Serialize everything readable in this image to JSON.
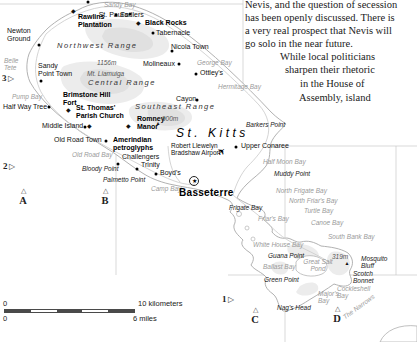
{
  "map": {
    "island_label": {
      "name": "St. Kitts",
      "pos": [
        176,
        127
      ]
    },
    "colors": {
      "water_label": "#9a9a9a",
      "land_shade": "#ececec",
      "coastline": "#a8a8a8",
      "graticule": "#c9c9c9",
      "scale_dark": "#4a4a4a"
    },
    "article": {
      "lines": [
        {
          "text": "Nevis, and the question of secession",
          "x": 245,
          "y": -1
        },
        {
          "text": "has been openly discussed. There is",
          "x": 245,
          "y": 12
        },
        {
          "text": "a very real prospect that Nevis will",
          "x": 245,
          "y": 25
        },
        {
          "text": "go solo in the near future.",
          "x": 245,
          "y": 38
        },
        {
          "text": "While local politicians",
          "x": 280,
          "y": 51
        },
        {
          "text": "sharpen their rhetoric",
          "x": 285,
          "y": 64
        },
        {
          "text": "in the House of",
          "x": 300,
          "y": 78
        },
        {
          "text": "Assembly, island",
          "x": 299,
          "y": 92
        }
      ]
    },
    "ranges": [
      {
        "name": "Northwest Range",
        "pos": [
          57,
          42
        ]
      },
      {
        "name": "Central Range",
        "pos": [
          88,
          79
        ]
      },
      {
        "name": "Southeast Range",
        "pos": [
          135,
          103
        ]
      }
    ],
    "towns": [
      {
        "name": "St. Paul's",
        "dot": [
          130,
          14
        ],
        "label": [
          128,
          11
        ],
        "align": "right"
      },
      {
        "name": "Sadlers",
        "dot": [
          116,
          15
        ],
        "label": [
          120,
          11
        ]
      },
      {
        "name": "Tabernacle",
        "dot": [
          153,
          33
        ],
        "label": [
          156,
          29
        ]
      },
      {
        "name": "Newton\nGround",
        "dot": [
          39,
          45
        ],
        "label": [
          7,
          27
        ]
      },
      {
        "name": "Nicola Town",
        "dot": [
          172,
          51
        ],
        "label": [
          171,
          43
        ]
      },
      {
        "name": "Sandy\nPoint Town",
        "dot": [
          41,
          81
        ],
        "label": [
          38,
          62
        ]
      },
      {
        "name": "Molineaux",
        "dot": [
          179,
          64
        ],
        "label": [
          143,
          60
        ]
      },
      {
        "name": "Ottley's",
        "dot": [
          196,
          74
        ],
        "label": [
          200,
          69
        ]
      },
      {
        "name": "Cayon",
        "dot": [
          197,
          100
        ],
        "label": [
          176,
          95
        ]
      },
      {
        "name": "Half Way Tree",
        "dot": [
          49,
          107
        ],
        "label": [
          3,
          103
        ]
      },
      {
        "name": "Middle Island",
        "dot": [
          85,
          127
        ],
        "label": [
          42,
          122
        ]
      },
      {
        "name": "Old Road Town",
        "dot": [
          106,
          141
        ],
        "label": [
          54,
          136
        ]
      },
      {
        "name": "Challengers",
        "dot": [
          118,
          164
        ],
        "label": [
          122,
          153
        ]
      },
      {
        "name": "Trinity",
        "dot": [
          137,
          169
        ],
        "label": [
          141,
          161
        ]
      },
      {
        "name": "Boyd's",
        "dot": [
          156,
          174
        ],
        "label": [
          160,
          169
        ]
      },
      {
        "name": "Upper Conaree",
        "dot": [
          236,
          147
        ],
        "label": [
          241,
          142
        ]
      }
    ],
    "sites": [
      {
        "name": "Rawlins\nPlantation",
        "diamond": [
          73,
          11
        ],
        "label": [
          78,
          13
        ]
      },
      {
        "name": "Black Rocks",
        "diamond": [
          138,
          23
        ],
        "label": [
          145,
          19
        ]
      },
      {
        "name": "Brimstone Hill\nFort",
        "diamond": [
          68,
          110
        ],
        "label": [
          63,
          91
        ]
      },
      {
        "name": "St. Thomas'\nParish Church",
        "diamond": [
          89,
          126
        ],
        "label": [
          76,
          104
        ]
      },
      {
        "name": "Romney\nManor",
        "diamond": [
          128,
          126
        ],
        "label": [
          137,
          115
        ]
      },
      {
        "name": "Amerindian\npetroglyphs",
        "diamond": null,
        "label": [
          113,
          136
        ]
      }
    ],
    "peaks": [
      {
        "name": "1156m",
        "label": [
          97,
          59
        ],
        "tri": null
      },
      {
        "name": "Mt. Liamuiga",
        "label": [
          87,
          70
        ],
        "tri": null
      },
      {
        "name": "900m",
        "label": [
          162,
          115
        ],
        "tri": [
          158,
          123
        ]
      },
      {
        "name": "319m",
        "label": [
          332,
          253
        ],
        "tri": [
          347,
          263
        ]
      }
    ],
    "water": [
      {
        "name": "Sandy Bay",
        "pos": [
          104,
          1
        ]
      },
      {
        "name": "Belle\nTete",
        "pos": [
          4,
          57
        ]
      },
      {
        "name": "Pump Bay",
        "pos": [
          12,
          93
        ]
      },
      {
        "name": "Old Road Bay",
        "pos": [
          72,
          151
        ]
      },
      {
        "name": "George Bay",
        "pos": [
          197,
          59
        ]
      },
      {
        "name": "Hermitage Bay",
        "pos": [
          218,
          83
        ]
      },
      {
        "name": "Camp Bay",
        "pos": [
          151,
          185
        ]
      },
      {
        "name": "Half Moon Bay",
        "pos": [
          263,
          158
        ]
      },
      {
        "name": "North Frigate Bay",
        "pos": [
          276,
          187
        ]
      },
      {
        "name": "North Friar's Bay",
        "pos": [
          289,
          197
        ]
      },
      {
        "name": "Friar's Bay",
        "pos": [
          258,
          215
        ]
      },
      {
        "name": "Turtle Bay",
        "pos": [
          304,
          207
        ]
      },
      {
        "name": "Canoe Bay",
        "pos": [
          311,
          219
        ]
      },
      {
        "name": "South Bank Bay",
        "pos": [
          328,
          233
        ]
      },
      {
        "name": "White House Bay",
        "pos": [
          253,
          241
        ]
      },
      {
        "name": "Ballast Bay",
        "pos": [
          263,
          263
        ]
      },
      {
        "name": "Great Salt\nPond",
        "pos": [
          318,
          258
        ],
        "align": "center"
      },
      {
        "name": "Cockleshell\nBay",
        "pos": [
          337,
          285
        ]
      },
      {
        "name": "Major's\nBay",
        "pos": [
          318,
          290
        ]
      },
      {
        "name": "The Narrows",
        "pos": [
          340,
          303
        ],
        "rotate": -36
      }
    ],
    "points": [
      {
        "name": "Barkers Point",
        "pos": [
          246,
          121
        ]
      },
      {
        "name": "Bloody Point",
        "pos": [
          82,
          165
        ]
      },
      {
        "name": "Palmetto Point",
        "pos": [
          103,
          176
        ]
      },
      {
        "name": "Muddy Point",
        "pos": [
          274,
          170
        ]
      },
      {
        "name": "Frigate Bay",
        "pos": [
          229,
          204
        ]
      },
      {
        "name": "Guana Point",
        "pos": [
          268,
          252
        ]
      },
      {
        "name": "Green Point",
        "pos": [
          264,
          276
        ]
      },
      {
        "name": "Nag's Head",
        "pos": [
          277,
          304
        ]
      },
      {
        "name": "Mosquito\nBluff",
        "pos": [
          361,
          255
        ]
      },
      {
        "name": "Scotch\nBonnet",
        "pos": [
          353,
          270
        ]
      }
    ],
    "capital": {
      "name": "Basseterre",
      "star": [
        194,
        181
      ],
      "label": [
        179,
        187
      ]
    },
    "airport": {
      "name": "Robert Llewelyn\nBradshaw Airport",
      "label": [
        171,
        142
      ],
      "plane": [
        222,
        152
      ]
    },
    "extra_dots": [
      [
        88,
        2
      ]
    ],
    "grid_edge_refs": [
      {
        "n": "3",
        "x": 2,
        "y": 73
      },
      {
        "n": "2",
        "x": 3,
        "y": 161
      },
      {
        "n": "1",
        "x": 222,
        "y": 294
      }
    ],
    "grid_corner_refs": [
      {
        "n": "A",
        "x": 16,
        "y": 188
      },
      {
        "n": "B",
        "x": 98,
        "y": 188
      },
      {
        "n": "C",
        "x": 248,
        "y": 307
      },
      {
        "n": "D",
        "x": 330,
        "y": 306
      }
    ],
    "scale": {
      "km_zero": "0",
      "km_label": "10 kilometers",
      "mi_zero": "0",
      "mi_label": "6 miles"
    }
  }
}
